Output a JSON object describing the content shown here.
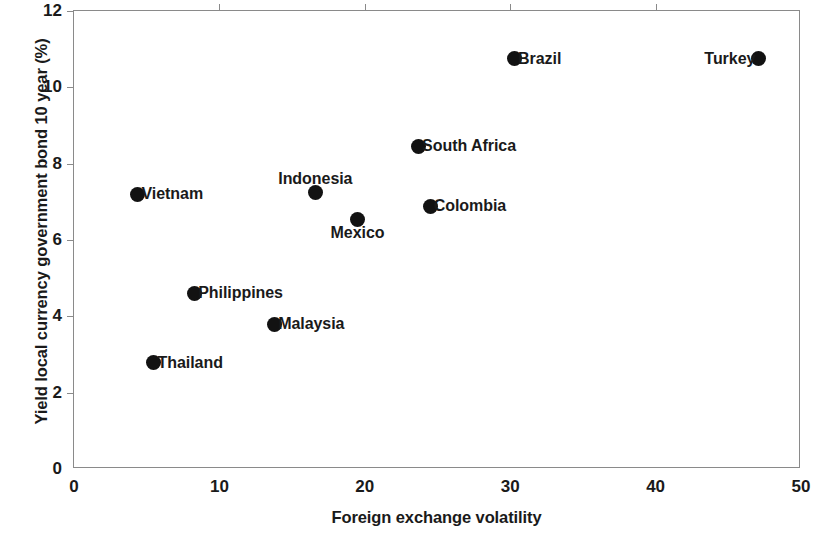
{
  "chart_data": {
    "type": "scatter",
    "title": "",
    "subtitle": "",
    "xlabel": "Foreign exchange volatility",
    "ylabel": "Yield local currency government bond 10 year (%)",
    "xlim": [
      0,
      50
    ],
    "ylim": [
      0,
      12
    ],
    "xticks": [
      "0",
      "10",
      "20",
      "30",
      "40",
      "50"
    ],
    "xtick_values": [
      0,
      10,
      20,
      30,
      40,
      50
    ],
    "yticks": [
      "0",
      "2",
      "4",
      "6",
      "8",
      "10",
      "12"
    ],
    "ytick_values": [
      0,
      2,
      4,
      6,
      8,
      10,
      12
    ],
    "grid": false,
    "legend": false,
    "marker_color": "#121212",
    "axis_color": "#8a8a8a",
    "points": [
      {
        "label": "Vietnam",
        "x": 4.4,
        "y": 7.2,
        "label_pos": "right"
      },
      {
        "label": "Thailand",
        "x": 5.5,
        "y": 2.78,
        "label_pos": "right"
      },
      {
        "label": "Philippines",
        "x": 8.3,
        "y": 4.6,
        "label_pos": "right"
      },
      {
        "label": "Malaysia",
        "x": 13.8,
        "y": 3.79,
        "label_pos": "right"
      },
      {
        "label": "Indonesia",
        "x": 16.6,
        "y": 7.25,
        "label_pos": "above"
      },
      {
        "label": "Mexico",
        "x": 19.5,
        "y": 6.55,
        "label_pos": "below"
      },
      {
        "label": "South Africa",
        "x": 23.7,
        "y": 8.45,
        "label_pos": "right"
      },
      {
        "label": "Colombia",
        "x": 24.5,
        "y": 6.88,
        "label_pos": "right"
      },
      {
        "label": "Brazil",
        "x": 30.3,
        "y": 10.75,
        "label_pos": "right"
      },
      {
        "label": "Turkey",
        "x": 47.1,
        "y": 10.75,
        "label_pos": "left"
      }
    ]
  }
}
